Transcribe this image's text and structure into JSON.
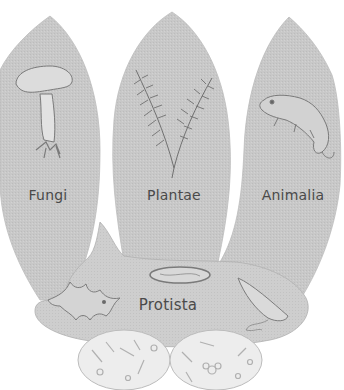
{
  "diagram": {
    "type": "five-kingdoms",
    "colors": {
      "background": "#ffffff",
      "lobe_fill": "#c9c9c9",
      "protista_fill": "#cfcfcf",
      "monera_fill": "#ececec",
      "outline": "#b5b5b5",
      "illustration_stroke": "#7a7a7a",
      "label_text": "#4a4a4a"
    },
    "kingdoms": [
      {
        "id": "fungi",
        "label": "Fungi",
        "illustration": "mushroom"
      },
      {
        "id": "plantae",
        "label": "Plantae",
        "illustration": "fern"
      },
      {
        "id": "animalia",
        "label": "Animalia",
        "illustration": "chameleon"
      },
      {
        "id": "protista",
        "label": "Protista",
        "illustration": [
          "amoeba",
          "paramecium",
          "euglena"
        ]
      },
      {
        "id": "monera",
        "label": "",
        "illustration": [
          "bacteria-left",
          "bacteria-right"
        ]
      }
    ]
  }
}
